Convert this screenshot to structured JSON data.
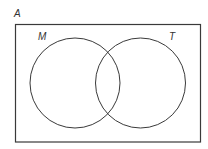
{
  "diagram": {
    "type": "venn",
    "universal_set": {
      "label": "A"
    },
    "sets": [
      {
        "label": "M"
      },
      {
        "label": "T"
      }
    ],
    "colors": {
      "stroke": "#3a3a3a",
      "background": "#ffffff",
      "label": "#333333"
    }
  }
}
